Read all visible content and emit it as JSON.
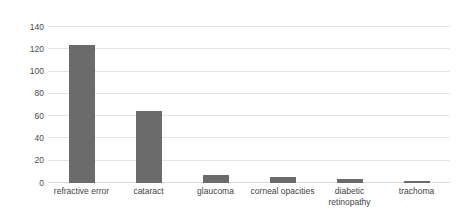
{
  "chart_data": {
    "type": "bar",
    "title": "",
    "subtitle": "",
    "xlabel": "",
    "ylabel": "",
    "categories": [
      "refractive error",
      "cataract",
      "glaucoma",
      "corneal opacities",
      "diabetic\nretinopathy",
      "trachoma"
    ],
    "values": [
      124,
      65,
      7,
      5,
      4,
      2
    ],
    "series": [
      {
        "name": "cases",
        "values": [
          124,
          65,
          7,
          5,
          4,
          2
        ]
      }
    ],
    "ylim": [
      0,
      140
    ],
    "ytick_labels": [
      "0",
      "20",
      "40",
      "60",
      "80",
      "100",
      "120",
      "140"
    ],
    "ytick_values": [
      0,
      20,
      40,
      60,
      80,
      100,
      120,
      140
    ],
    "grid": true,
    "legend": false,
    "legend_position": "none",
    "bar_color": "#6b6b6b",
    "gridline_color": "#e2e2e2",
    "background_color": "#ffffff",
    "axis_text_color": "#4a4a4a"
  }
}
